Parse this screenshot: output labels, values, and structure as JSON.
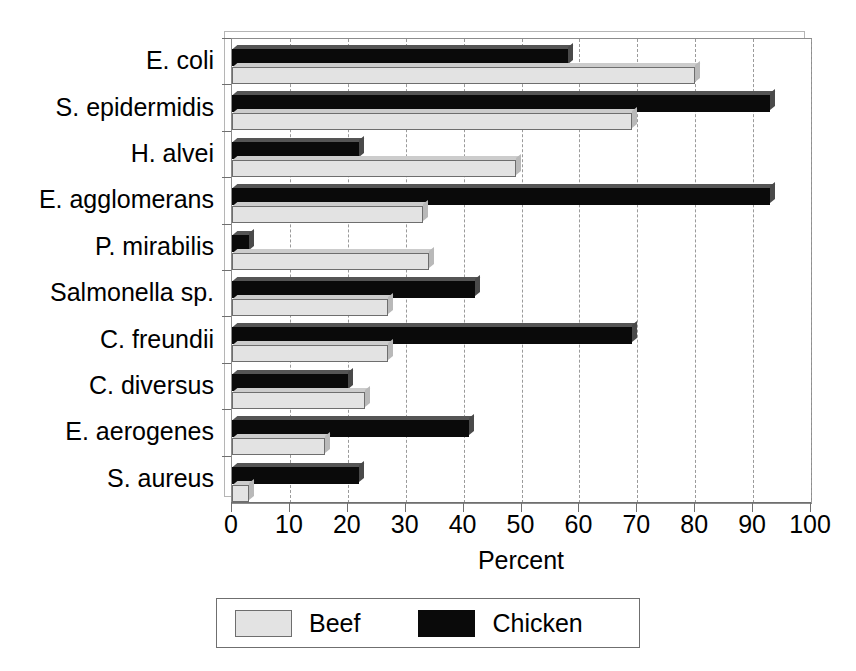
{
  "chart_data": {
    "type": "bar",
    "orientation": "horizontal",
    "title": "",
    "xlabel": "Percent",
    "ylabel": "",
    "xlim": [
      0,
      100
    ],
    "xticks": [
      0,
      10,
      20,
      30,
      40,
      50,
      60,
      70,
      80,
      90,
      100
    ],
    "xtick_labels": [
      "0",
      "10",
      "20",
      "30",
      "40",
      "50",
      "60",
      "70",
      "80",
      "90",
      "100"
    ],
    "grid": "vertical-dashed",
    "legend_position": "bottom",
    "categories": [
      "E. coli",
      "S. epidermidis",
      "H. alvei",
      "E. agglomerans",
      "P. mirabilis",
      "Salmonella sp.",
      "C. freundii",
      "C. diversus",
      "E. aerogenes",
      "S. aureus"
    ],
    "series": [
      {
        "name": "Beef",
        "color": "#e3e3e3",
        "values": [
          80,
          69,
          49,
          33,
          34,
          27,
          27,
          23,
          16,
          3
        ]
      },
      {
        "name": "Chicken",
        "color": "#0a0a0a",
        "values": [
          58,
          93,
          22,
          93,
          3,
          42,
          69,
          20,
          41,
          22
        ]
      }
    ]
  },
  "legend": {
    "entries": [
      {
        "label": "Beef",
        "swatch": "beef"
      },
      {
        "label": "Chicken",
        "swatch": "chicken"
      }
    ]
  }
}
